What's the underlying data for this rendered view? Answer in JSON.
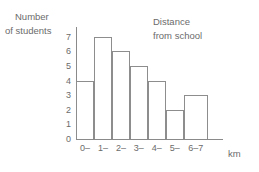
{
  "chart_data": {
    "type": "bar",
    "title": "",
    "annotation": [
      "Distance",
      "from school"
    ],
    "ylabel_lines": [
      "Number",
      "of students"
    ],
    "xlabel": "km",
    "categories": [
      "0–",
      "1–",
      "2–",
      "3–",
      "4–",
      "5–",
      "6–7"
    ],
    "values": [
      4,
      7,
      6,
      5,
      4,
      2,
      3
    ],
    "bar_widths": [
      1,
      1,
      1,
      1,
      1,
      1,
      1.35
    ],
    "yticks": [
      0,
      1,
      2,
      3,
      4,
      5,
      6,
      7
    ],
    "ylim": [
      0,
      7.6
    ],
    "grid": false,
    "legend": "none",
    "colors": {
      "bar_fill": "#ffffff",
      "bar_stroke": "#8d8d8d",
      "axis": "#8a8a8a",
      "text": "#6b6b6b",
      "background": "#ffffff"
    }
  }
}
